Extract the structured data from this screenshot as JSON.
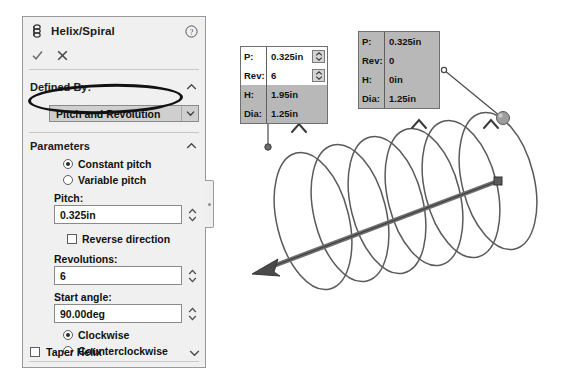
{
  "panel": {
    "title": "Helix/Spiral",
    "icon": "helix-spiral-icon",
    "help_icon": "help-icon",
    "ok_label": "OK",
    "cancel_label": "Cancel",
    "defined_by": {
      "header": "Defined By:",
      "value": "Pitch and Revolution",
      "highlighted": true
    },
    "parameters": {
      "header": "Parameters",
      "pitch_mode": {
        "constant_label": "Constant pitch",
        "variable_label": "Variable pitch",
        "selected": "constant"
      },
      "pitch": {
        "label": "Pitch:",
        "value": "0.325in"
      },
      "reverse_direction": {
        "label": "Reverse direction",
        "checked": false
      },
      "revolutions": {
        "label": "Revolutions:",
        "value": "6"
      },
      "start_angle": {
        "label": "Start angle:",
        "value": "90.00deg"
      },
      "direction": {
        "clockwise_label": "Clockwise",
        "counterclockwise_label": "Counterclockwise",
        "selected": "clockwise"
      }
    },
    "taper_helix": {
      "label": "Taper Helix",
      "checked": false
    }
  },
  "callouts": [
    {
      "name": "helix-end-callout",
      "rows": [
        {
          "key": "P:",
          "value": "0.325in",
          "editable": true
        },
        {
          "key": "Rev:",
          "value": "6",
          "editable": true
        },
        {
          "key": "H:",
          "value": "1.95in",
          "editable": false
        },
        {
          "key": "Dia:",
          "value": "1.25in",
          "editable": false
        }
      ]
    },
    {
      "name": "helix-start-callout",
      "rows": [
        {
          "key": "P:",
          "value": "0.325in",
          "editable": false
        },
        {
          "key": "Rev:",
          "value": "0",
          "editable": false
        },
        {
          "key": "H:",
          "value": "0in",
          "editable": false
        },
        {
          "key": "Dia:",
          "value": "1.25in",
          "editable": false
        }
      ]
    }
  ],
  "colors": {
    "panel_bg": "#f0f0f0",
    "callout_bg": "#b8b8b8",
    "curve": "#555555",
    "highlight": "#111111"
  }
}
